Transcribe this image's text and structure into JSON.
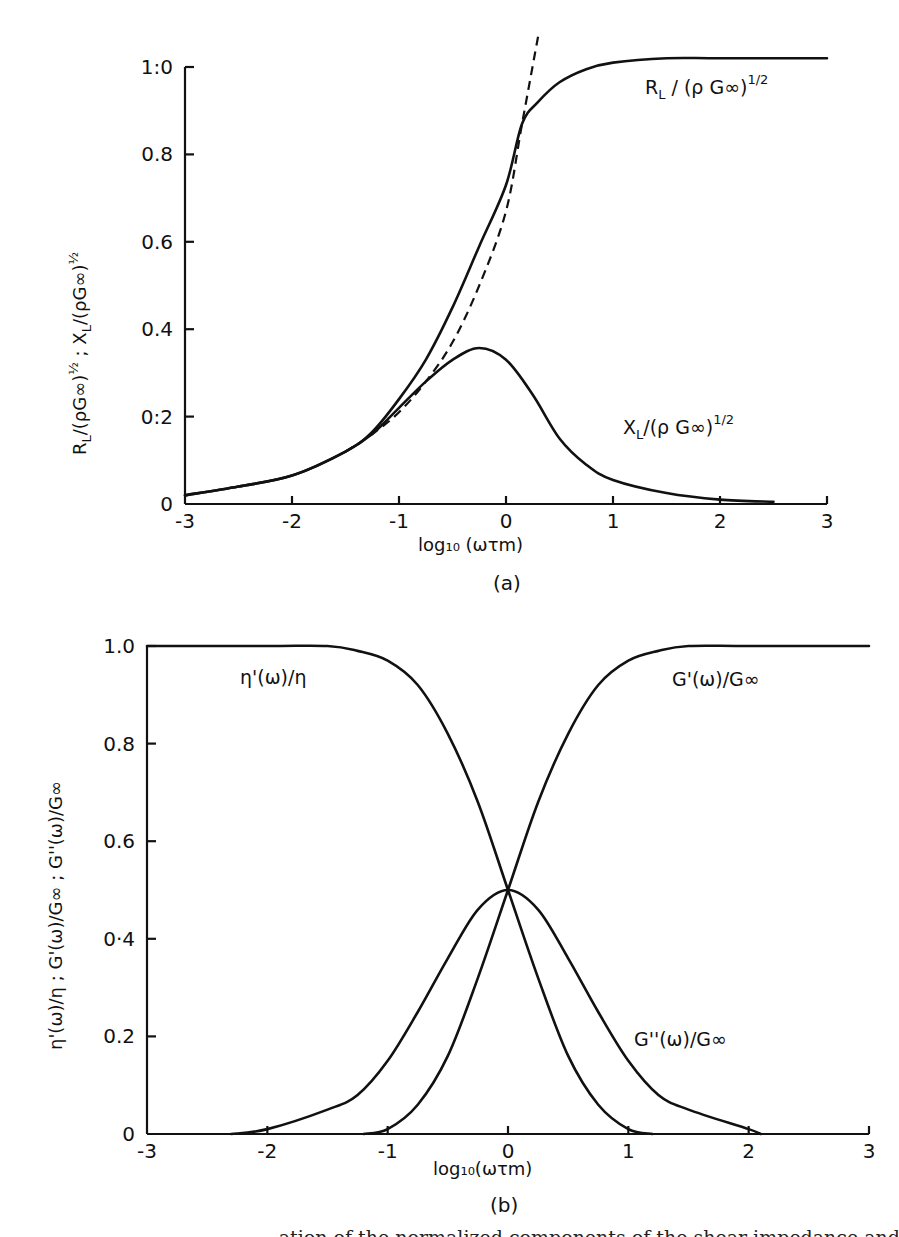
{
  "figure": {
    "caption_partial": "ation of the normalized components of the shear impedance and",
    "panels": [
      {
        "id": "a",
        "panel_label": "(a)",
        "xlabel": "log₁₀ (ωτm)",
        "ylabel": "R_L/(ρG∞)^½ ; X_L/(ρG∞)^½",
        "ylabel_parts": {
          "r": "R",
          "r_sub": "L",
          "x": "X",
          "x_sub": "L",
          "mid": "/(ρG∞)",
          "sup": "½",
          "sep": " ; "
        },
        "yticks": [
          "0",
          "0:2",
          "0.4",
          "0.6",
          "0.8",
          "1:0"
        ],
        "xticks": [
          "-3",
          "-2",
          "-1",
          "0",
          "1",
          "2",
          "3"
        ],
        "curve_labels": {
          "rl": {
            "main": "R",
            "sub": "L",
            "rest": " / (ρ G∞)",
            "sup": "1/2"
          },
          "xl": {
            "main": "X",
            "sub": "L",
            "rest": "/(ρ G∞)",
            "sup": "1/2"
          }
        }
      },
      {
        "id": "b",
        "panel_label": "(b)",
        "xlabel": "log₁₀(ωτm)",
        "ylabel": "η'(ω)/η ;  G'(ω)/G∞ ;  G''(ω)/G∞",
        "yticks": [
          "0",
          "0.2",
          "0·4",
          "0.6",
          "0.8",
          "1.0"
        ],
        "xticks": [
          "-3",
          "-2",
          "-1",
          "0",
          "1",
          "2",
          "3"
        ],
        "curve_labels": {
          "eta": "η'(ω)/η",
          "gp": "G'(ω)/G∞",
          "gpp": "G''(ω)/G∞"
        }
      }
    ]
  },
  "chart_data": [
    {
      "type": "line",
      "title": "(a)",
      "xlabel": "log10(ωτm)",
      "ylabel": "R_L/(ρG∞)^1/2 ; X_L/(ρG∞)^1/2",
      "xlim": [
        -3,
        3
      ],
      "ylim": [
        0,
        1.0
      ],
      "grid": false,
      "legend": "inline labels",
      "series": [
        {
          "name": "R_L/(ρG∞)^1/2",
          "style": "solid",
          "x": [
            -3,
            -2.5,
            -2,
            -1.5,
            -1.25,
            -1,
            -0.75,
            -0.5,
            -0.25,
            0,
            0.15,
            0.3,
            0.5,
            0.75,
            1,
            1.5,
            2,
            3
          ],
          "values": [
            0.02,
            0.04,
            0.065,
            0.12,
            0.165,
            0.24,
            0.33,
            0.45,
            0.59,
            0.73,
            0.87,
            0.92,
            0.965,
            0.995,
            1.01,
            1.02,
            1.02,
            1.02
          ]
        },
        {
          "name": "X_L/(ρG∞)^1/2",
          "style": "solid",
          "x": [
            -3,
            -2.5,
            -2,
            -1.5,
            -1.25,
            -1,
            -0.75,
            -0.5,
            -0.25,
            0,
            0.25,
            0.5,
            0.75,
            1,
            1.5,
            2,
            2.5
          ],
          "values": [
            0.02,
            0.04,
            0.065,
            0.12,
            0.16,
            0.22,
            0.28,
            0.33,
            0.357,
            0.33,
            0.25,
            0.15,
            0.09,
            0.055,
            0.025,
            0.01,
            0.005
          ]
        },
        {
          "name": "low-frequency asymptote",
          "style": "dashed",
          "x": [
            -1.5,
            -1.25,
            -1,
            -0.75,
            -0.5,
            -0.25,
            0,
            0.15,
            0.3
          ],
          "values": [
            0.12,
            0.16,
            0.21,
            0.28,
            0.37,
            0.5,
            0.67,
            0.87,
            1.07
          ]
        }
      ]
    },
    {
      "type": "line",
      "title": "(b)",
      "xlabel": "log10(ωτm)",
      "ylabel": "η'(ω)/η ; G'(ω)/G∞ ; G''(ω)/G∞",
      "xlim": [
        -3,
        3
      ],
      "ylim": [
        0,
        1.0
      ],
      "grid": false,
      "legend": "inline labels",
      "series": [
        {
          "name": "η'(ω)/η",
          "x": [
            -3,
            -2,
            -1.5,
            -1.25,
            -1,
            -0.75,
            -0.5,
            -0.25,
            0,
            0.25,
            0.5,
            0.75,
            1,
            1.2
          ],
          "values": [
            1.0,
            1.0,
            1.0,
            0.99,
            0.97,
            0.92,
            0.82,
            0.68,
            0.5,
            0.32,
            0.16,
            0.06,
            0.01,
            0.0
          ]
        },
        {
          "name": "G'(ω)/G∞",
          "x": [
            -1.2,
            -1,
            -0.75,
            -0.5,
            -0.25,
            0,
            0.25,
            0.5,
            0.75,
            1,
            1.25,
            1.5,
            2,
            3
          ],
          "values": [
            0.0,
            0.01,
            0.06,
            0.16,
            0.32,
            0.5,
            0.68,
            0.82,
            0.92,
            0.97,
            0.99,
            1.0,
            1.0,
            1.0
          ]
        },
        {
          "name": "G''(ω)/G∞",
          "x": [
            -2.3,
            -2,
            -1.5,
            -1.25,
            -1,
            -0.75,
            -0.5,
            -0.25,
            0,
            0.25,
            0.5,
            0.75,
            1,
            1.25,
            1.5,
            2,
            2.1
          ],
          "values": [
            0.0,
            0.01,
            0.05,
            0.08,
            0.15,
            0.25,
            0.36,
            0.46,
            0.5,
            0.46,
            0.36,
            0.25,
            0.15,
            0.08,
            0.05,
            0.01,
            0.0
          ]
        }
      ]
    }
  ]
}
